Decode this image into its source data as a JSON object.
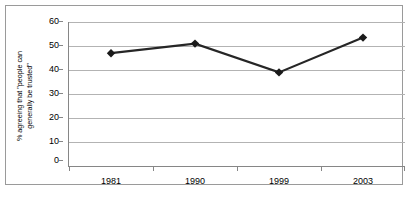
{
  "chart_data": {
    "type": "line",
    "title": "",
    "subtitle": "",
    "xlabel": "",
    "ylabel": "% agreeing that \"people can generally be trusted\"",
    "ylabel_line1": "% agreeing that \"people can",
    "ylabel_line2": "generally be trusted\"",
    "categories": [
      "1981",
      "1990",
      "1999",
      "2003"
    ],
    "values": [
      47,
      51,
      39,
      53.5
    ],
    "ylim": [
      0,
      60
    ],
    "ytick_labels": [
      "0",
      "10",
      "20",
      "30",
      "40",
      "50",
      "60"
    ],
    "ytick_values": [
      0,
      10,
      20,
      30,
      40,
      50,
      60
    ],
    "grid": true,
    "legend": "none",
    "marker": "diamond",
    "series": [
      {
        "name": "% agreeing that \"people can generally be trusted\"",
        "values": [
          47,
          51,
          39,
          53.5
        ]
      }
    ],
    "colors": {
      "line": "#262626",
      "marker": "#1a1a1a",
      "gridline": "#b3b3b3",
      "axis": "#868686",
      "frame": "#9a9a9a",
      "background": "#ffffff",
      "text": "#000000"
    }
  },
  "caption": {
    "clipped_text": ""
  }
}
